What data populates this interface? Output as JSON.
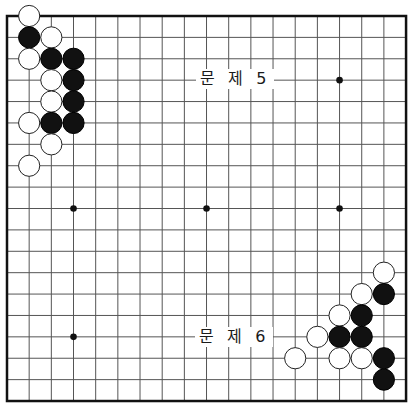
{
  "board": {
    "size": 19,
    "origin_x": 7,
    "origin_y": 16,
    "step_x": 22.17,
    "step_y": 21.39,
    "line_color": "#555555",
    "border_color": "#111111",
    "stone_black": "#111111",
    "stone_white": "#ffffff",
    "hoshi": [
      [
        3,
        3
      ],
      [
        9,
        3
      ],
      [
        15,
        3
      ],
      [
        3,
        9
      ],
      [
        9,
        9
      ],
      [
        15,
        9
      ],
      [
        3,
        15
      ],
      [
        9,
        15
      ],
      [
        15,
        15
      ]
    ],
    "visible_hoshi": [
      [
        15,
        3
      ],
      [
        3,
        9
      ],
      [
        9,
        9
      ],
      [
        15,
        9
      ],
      [
        3,
        15
      ]
    ]
  },
  "problems": [
    {
      "label": "문 제 5",
      "label_pos": {
        "x": 196,
        "y": 69
      },
      "stones": [
        {
          "color": "white",
          "col": 1,
          "row": 0
        },
        {
          "color": "black",
          "col": 1,
          "row": 1
        },
        {
          "color": "white",
          "col": 2,
          "row": 1
        },
        {
          "color": "white",
          "col": 1,
          "row": 2
        },
        {
          "color": "black",
          "col": 2,
          "row": 2
        },
        {
          "color": "black",
          "col": 3,
          "row": 2
        },
        {
          "color": "white",
          "col": 2,
          "row": 3
        },
        {
          "color": "black",
          "col": 3,
          "row": 3
        },
        {
          "color": "white",
          "col": 2,
          "row": 4
        },
        {
          "color": "black",
          "col": 3,
          "row": 4
        },
        {
          "color": "white",
          "col": 1,
          "row": 5
        },
        {
          "color": "black",
          "col": 2,
          "row": 5
        },
        {
          "color": "black",
          "col": 3,
          "row": 5
        },
        {
          "color": "white",
          "col": 2,
          "row": 6
        },
        {
          "color": "white",
          "col": 1,
          "row": 7
        }
      ]
    },
    {
      "label": "문 제 6",
      "label_pos": {
        "x": 195,
        "y": 327
      },
      "stones": [
        {
          "color": "white",
          "col": 17,
          "row": 12
        },
        {
          "color": "white",
          "col": 16,
          "row": 13
        },
        {
          "color": "black",
          "col": 17,
          "row": 13
        },
        {
          "color": "white",
          "col": 15,
          "row": 14
        },
        {
          "color": "black",
          "col": 16,
          "row": 14
        },
        {
          "color": "white",
          "col": 14,
          "row": 15
        },
        {
          "color": "black",
          "col": 15,
          "row": 15
        },
        {
          "color": "black",
          "col": 16,
          "row": 15
        },
        {
          "color": "white",
          "col": 13,
          "row": 16
        },
        {
          "color": "white",
          "col": 15,
          "row": 16
        },
        {
          "color": "white",
          "col": 16,
          "row": 16
        },
        {
          "color": "black",
          "col": 17,
          "row": 16
        },
        {
          "color": "black",
          "col": 17,
          "row": 17
        }
      ]
    }
  ]
}
